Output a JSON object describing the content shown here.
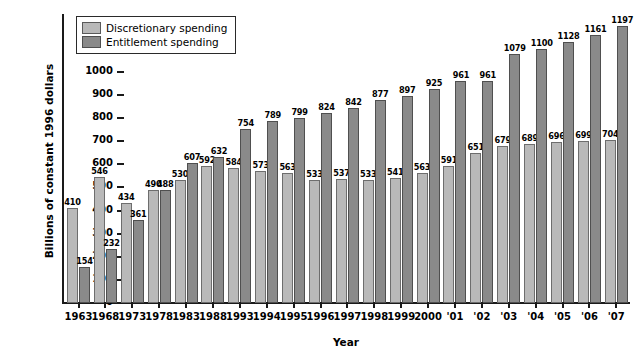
{
  "chart_data": {
    "type": "bar",
    "title": "",
    "xlabel": "Year",
    "ylabel": "Billions of constant 1996 dollars",
    "ylim": [
      0,
      1250
    ],
    "yticks": [
      0,
      100,
      200,
      300,
      400,
      500,
      600,
      700,
      800,
      900,
      1000,
      1100,
      1200
    ],
    "grid": false,
    "legend_position": "top-left",
    "categories": [
      "1963",
      "1968",
      "1973",
      "1978",
      "1983",
      "1988",
      "1993",
      "1994",
      "1995",
      "1996",
      "1997",
      "1998",
      "1999",
      "2000",
      "'01",
      "'02",
      "'03",
      "'04",
      "'05",
      "'06",
      "'07"
    ],
    "series": [
      {
        "name": "Discretionary spending",
        "color": "#b9b9b9",
        "values": [
          410,
          546,
          434,
          490,
          530,
          592,
          584,
          573,
          563,
          533,
          537,
          533,
          541,
          563,
          591,
          651,
          679,
          689,
          696,
          699,
          704
        ]
      },
      {
        "name": "Entitlement spending",
        "color": "#8a8a8a",
        "values": [
          154,
          232,
          361,
          488,
          607,
          632,
          754,
          789,
          799,
          824,
          842,
          877,
          897,
          925,
          961,
          961,
          1079,
          1100,
          1128,
          1161,
          1197
        ]
      }
    ]
  },
  "legend": {
    "items": [
      {
        "label": "Discretionary spending",
        "swatch": "discretionary"
      },
      {
        "label": "Entitlement spending",
        "swatch": "entitlement"
      }
    ]
  }
}
